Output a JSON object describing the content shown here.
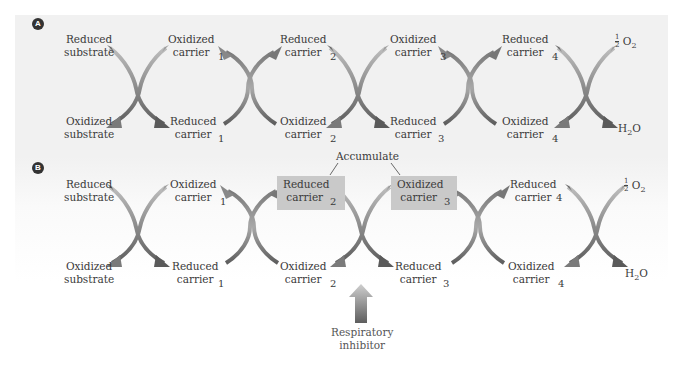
{
  "panels": {
    "A": {
      "badge": "A",
      "top_row": [
        "Reduced\nsubstrate",
        "Oxidized\ncarrier",
        "Reduced\ncarrier",
        "Oxidized\ncarrier",
        "Reduced\ncarrier",
        "½ O2"
      ],
      "bottom_row": [
        "Oxidized\nsubstrate",
        "Reduced\ncarrier",
        "Oxidized\ncarrier",
        "Reduced\ncarrier",
        "Oxidized\ncarrier",
        "H2O"
      ]
    },
    "B": {
      "badge": "B"
    }
  },
  "labels": {
    "reduced": "Reduced",
    "oxidized": "Oxidized",
    "substrate": "substrate",
    "carrier": "carrier",
    "sub1": "1",
    "sub2": "2",
    "sub3": "3",
    "sub4": "4",
    "half": "1",
    "half_den": "2",
    "o2": "O",
    "o2_sub": "2",
    "h": "H",
    "h2o_sub": "2",
    "o": "O"
  },
  "annotations": {
    "accumulate": "Accumulate",
    "inhibitor_line1": "Respiratory",
    "inhibitor_line2": "inhibitor"
  },
  "colors": {
    "panel_bg": "#f1f1f1",
    "arrow_light": "#b7b7b7",
    "arrow_dark": "#6e6e6e",
    "highlight_box": "#c9c9c9",
    "inhibitor_arrow_top": "#c8c8c8",
    "inhibitor_arrow_bottom": "#6a6a6a"
  }
}
